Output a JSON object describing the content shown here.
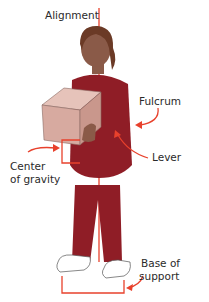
{
  "labels": {
    "alignment": "Alignment",
    "fulcrum": "Fulcrum",
    "lever": "Lever",
    "center_of_gravity_line1": "Center",
    "center_of_gravity_line2": "of gravity",
    "base_of_support_line1": "Base of",
    "base_of_support_line2": "support"
  },
  "colors": {
    "annotation_red": "#e8412c",
    "scrubs": "#8f1d26",
    "box": "#d7aaa0",
    "skin": "#8a5a48",
    "hair": "#6b3a26"
  }
}
